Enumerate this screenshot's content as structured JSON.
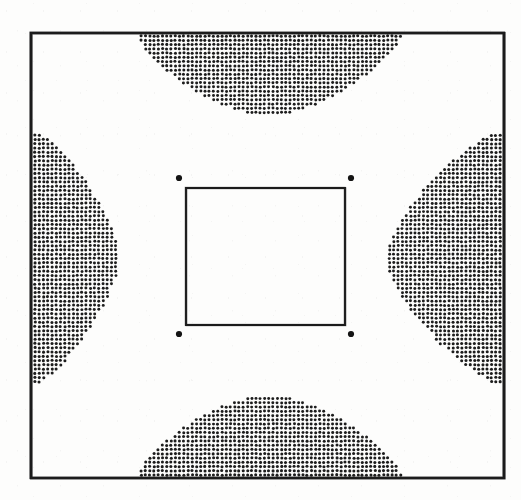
{
  "figure": {
    "kind": "stippled-field-contour-figure",
    "background_color": "#fdfdfc",
    "ink_color": "#1a1a1a",
    "canvas": {
      "width": 521,
      "height": 500
    },
    "outer_frame": {
      "name": "outer-boundary-square",
      "x": 31,
      "y": 33,
      "width": 473,
      "height": 445,
      "stroke_width": 2.6,
      "stroke_color": "#1c1c1c",
      "fill": "none"
    },
    "inner_frame": {
      "name": "inner-boundary-square",
      "x": 186,
      "y": 188,
      "width": 159,
      "height": 137,
      "stroke_width": 1.9,
      "stroke_color": "#1c1c1c",
      "fill": "none"
    },
    "corner_dots": {
      "name": "inner-square-corner-markers",
      "radius": 3.1,
      "color": "#141414",
      "points": [
        {
          "label": "top-left-dot",
          "x": 179,
          "y": 178
        },
        {
          "label": "top-right-dot",
          "x": 351,
          "y": 178
        },
        {
          "label": "bottom-left-dot",
          "x": 179,
          "y": 334
        },
        {
          "label": "bottom-right-dot",
          "x": 351,
          "y": 334
        }
      ]
    },
    "stipple": {
      "dot_pitch": 4.25,
      "dot_radius": 1.35,
      "dot_color": "#1d1d1d",
      "jitter": 0.34,
      "regions": [
        {
          "name": "top-stipple-lobe",
          "orientation": "top",
          "base_from": 137,
          "base_to": 401,
          "base_edge": 36,
          "apex_depth": 120,
          "inner_from": 214,
          "inner_to": 330,
          "curvature": 0.62
        },
        {
          "name": "left-stipple-lobe",
          "orientation": "left",
          "base_from": 131,
          "base_to": 385,
          "base_edge": 35,
          "apex_depth": 122,
          "inner_from": 196,
          "inner_to": 318,
          "curvature": 0.7
        },
        {
          "name": "right-stipple-lobe",
          "orientation": "right",
          "base_from": 131,
          "base_to": 385,
          "base_edge": 500,
          "apex_depth": 382,
          "inner_from": 196,
          "inner_to": 318,
          "curvature": 0.7
        },
        {
          "name": "bottom-stipple-lobe",
          "orientation": "bottom",
          "base_from": 137,
          "base_to": 401,
          "base_edge": 475,
          "apex_depth": 392,
          "inner_from": 214,
          "inner_to": 330,
          "curvature": 0.62
        }
      ]
    }
  }
}
